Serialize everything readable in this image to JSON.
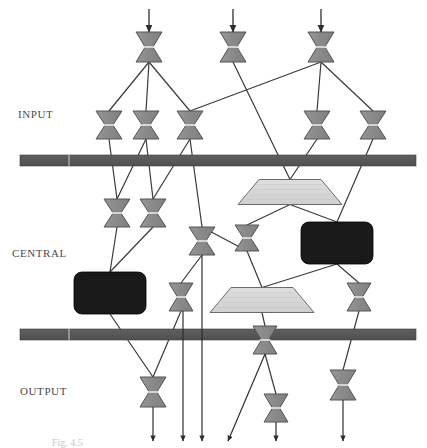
{
  "figure": {
    "caption": "Fig. 4.5",
    "background_color": "#ffffff"
  },
  "palette": {
    "valve_fill": "#8c8c8c",
    "valve_stroke": "#555555",
    "valve_highlight": "#e8e8e8",
    "trapezoid_fill": "#d6d6d6",
    "trapezoid_stroke": "#6b6b6b",
    "block_fill": "#1a1a1a",
    "bar_fill": "#5a5a5a",
    "bar_stroke": "#3d3d3d",
    "edge_color": "#3a3a3a",
    "label_color": "#4a4a4a"
  },
  "tiers": [
    {
      "id": "input",
      "label": "INPUT",
      "x": 18,
      "y": 108
    },
    {
      "id": "central",
      "label": "CENTRAL",
      "x": 12,
      "y": 247
    },
    {
      "id": "output",
      "label": "OUTPUT",
      "x": 20,
      "y": 385
    }
  ],
  "bars": [
    {
      "name": "input-boundary-bar",
      "x": 20,
      "y": 155,
      "width": 396,
      "height": 11
    },
    {
      "name": "output-boundary-bar",
      "x": 20,
      "y": 329,
      "width": 396,
      "height": 11
    }
  ],
  "valves": [
    {
      "id": "v-top-1",
      "cx": 149,
      "cy": 47,
      "w": 26,
      "h": 30,
      "tier": "source"
    },
    {
      "id": "v-top-2",
      "cx": 233,
      "cy": 47,
      "w": 26,
      "h": 30,
      "tier": "source"
    },
    {
      "id": "v-top-3",
      "cx": 321,
      "cy": 47,
      "w": 26,
      "h": 30,
      "tier": "source"
    },
    {
      "id": "v-in-1",
      "cx": 109,
      "cy": 125,
      "w": 26,
      "h": 28,
      "tier": "input"
    },
    {
      "id": "v-in-2",
      "cx": 146,
      "cy": 125,
      "w": 26,
      "h": 28,
      "tier": "input"
    },
    {
      "id": "v-in-3",
      "cx": 190,
      "cy": 125,
      "w": 26,
      "h": 28,
      "tier": "input"
    },
    {
      "id": "v-in-4",
      "cx": 317,
      "cy": 125,
      "w": 26,
      "h": 28,
      "tier": "input"
    },
    {
      "id": "v-in-5",
      "cx": 373,
      "cy": 125,
      "w": 26,
      "h": 28,
      "tier": "input"
    },
    {
      "id": "v-ce-1",
      "cx": 117,
      "cy": 213,
      "w": 26,
      "h": 28,
      "tier": "central"
    },
    {
      "id": "v-ce-2",
      "cx": 153,
      "cy": 213,
      "w": 26,
      "h": 28,
      "tier": "central"
    },
    {
      "id": "v-ce-3",
      "cx": 202,
      "cy": 241,
      "w": 26,
      "h": 28,
      "tier": "central"
    },
    {
      "id": "v-ce-4",
      "cx": 247,
      "cy": 238,
      "w": 24,
      "h": 26,
      "tier": "central"
    },
    {
      "id": "v-ce-5",
      "cx": 181,
      "cy": 297,
      "w": 24,
      "h": 28,
      "tier": "central"
    },
    {
      "id": "v-ce-6",
      "cx": 359,
      "cy": 297,
      "w": 24,
      "h": 28,
      "tier": "central"
    },
    {
      "id": "v-ce-7",
      "cx": 265,
      "cy": 340,
      "w": 24,
      "h": 28,
      "tier": "central"
    },
    {
      "id": "v-out-1",
      "cx": 153,
      "cy": 392,
      "w": 26,
      "h": 30,
      "tier": "output"
    },
    {
      "id": "v-out-2",
      "cx": 276,
      "cy": 408,
      "w": 24,
      "h": 28,
      "tier": "output"
    },
    {
      "id": "v-out-3",
      "cx": 343,
      "cy": 385,
      "w": 26,
      "h": 30,
      "tier": "output"
    }
  ],
  "trapezoids": [
    {
      "id": "tz-1",
      "cx": 290,
      "cy": 192,
      "top_w": 62,
      "bottom_w": 104,
      "h": 25
    },
    {
      "id": "tz-2",
      "cx": 262,
      "cy": 300,
      "top_w": 62,
      "bottom_w": 104,
      "h": 25
    }
  ],
  "blocks": [
    {
      "id": "blk-1",
      "x": 74,
      "y": 272,
      "w": 72,
      "h": 42,
      "r": 8
    },
    {
      "id": "blk-2",
      "x": 301,
      "y": 222,
      "w": 72,
      "h": 42,
      "r": 8
    }
  ],
  "inlet_arrows": [
    {
      "id": "in-arrow-1",
      "x": 149,
      "y1": 9,
      "y2": 32
    },
    {
      "id": "in-arrow-2",
      "x": 233,
      "y1": 9,
      "y2": 32
    },
    {
      "id": "in-arrow-3",
      "x": 321,
      "y1": 9,
      "y2": 32
    }
  ],
  "outlet_arrows": [
    {
      "id": "out-arrow-1",
      "x1": 153,
      "y1": 407,
      "x2": 153,
      "y2": 441
    },
    {
      "id": "out-arrow-2",
      "x1": 183,
      "y1": 311,
      "x2": 183,
      "y2": 441
    },
    {
      "id": "out-arrow-3",
      "x1": 202,
      "y1": 255,
      "x2": 202,
      "y2": 441
    },
    {
      "id": "out-arrow-4",
      "x1": 265,
      "y1": 354,
      "x2": 228,
      "y2": 441
    },
    {
      "id": "out-arrow-5",
      "x1": 276,
      "y1": 422,
      "x2": 276,
      "y2": 441
    },
    {
      "id": "out-arrow-6",
      "x1": 343,
      "y1": 400,
      "x2": 343,
      "y2": 441
    }
  ],
  "edges": [
    {
      "from": "v-top-1",
      "to": "v-in-1"
    },
    {
      "from": "v-top-1",
      "to": "v-in-2"
    },
    {
      "from": "v-top-1",
      "to": "v-in-3"
    },
    {
      "from": "v-top-2",
      "to": "tz-1"
    },
    {
      "from": "v-top-3",
      "to": "v-in-3"
    },
    {
      "from": "v-top-3",
      "to": "v-in-4"
    },
    {
      "from": "v-top-3",
      "to": "v-in-5"
    },
    {
      "from": "v-in-1",
      "to": "v-ce-1"
    },
    {
      "from": "v-in-2",
      "to": "v-ce-1"
    },
    {
      "from": "v-in-2",
      "to": "v-ce-2"
    },
    {
      "from": "v-in-3",
      "to": "v-ce-2"
    },
    {
      "from": "v-in-3",
      "to": "v-ce-3"
    },
    {
      "from": "v-in-4",
      "to": "tz-1"
    },
    {
      "from": "v-in-5",
      "to": "blk-2"
    },
    {
      "from": "v-ce-1",
      "to": "blk-1"
    },
    {
      "from": "v-ce-2",
      "to": "blk-1"
    },
    {
      "from": "tz-1",
      "to": "v-ce-4"
    },
    {
      "from": "tz-1",
      "to": "blk-2"
    },
    {
      "from": "v-ce-3",
      "to": "v-ce-4"
    },
    {
      "from": "v-ce-3",
      "to": "v-ce-5"
    },
    {
      "from": "v-ce-4",
      "to": "tz-2"
    },
    {
      "from": "blk-2",
      "to": "tz-2"
    },
    {
      "from": "blk-2",
      "to": "v-ce-6"
    },
    {
      "from": "tz-2",
      "to": "v-ce-7"
    },
    {
      "from": "blk-1",
      "to": "v-out-1"
    },
    {
      "from": "v-ce-5",
      "to": "v-out-1"
    },
    {
      "from": "v-ce-7",
      "to": "v-out-2"
    },
    {
      "from": "v-ce-6",
      "to": "v-out-3"
    }
  ]
}
